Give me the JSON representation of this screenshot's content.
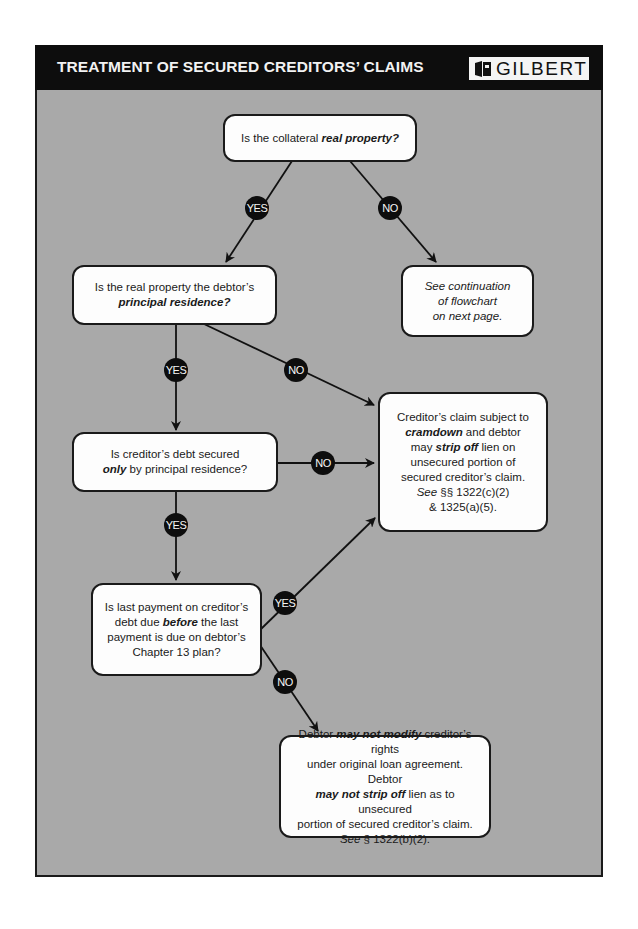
{
  "header": {
    "title": "TREATMENT OF SECURED CREDITORS’ CLAIMS",
    "logo_text": "GILBERT"
  },
  "colors": {
    "header_bg": "#0d0d0d",
    "panel_bg": "#a9a9a9",
    "box_bg": "#fdfdfd",
    "badge_bg": "#0d0d0d"
  },
  "nodes": {
    "q1": {
      "pre": "Is the collateral ",
      "em": "real property?"
    },
    "q2": {
      "line1": "Is the real property the debtor’s",
      "em": "principal residence?"
    },
    "cont": {
      "line1": "See continuation",
      "line2": "of flowchart",
      "line3": "on next page."
    },
    "q3": {
      "line1": "Is creditor’s debt secured",
      "em": "only",
      "post": " by principal residence?"
    },
    "cramdown": {
      "l1": "Creditor’s claim subject to",
      "l2_em": "cramdown",
      "l2_post": " and debtor",
      "l3_pre": "may ",
      "l3_em": "strip off",
      "l3_post": " lien on",
      "l4": "unsecured portion of",
      "l5": "secured creditor’s claim.",
      "l6_see": "See",
      "l6_post": " §§ 1322(c)(2)",
      "l7": "& 1325(a)(5)."
    },
    "q4": {
      "l1": "Is last payment on creditor’s",
      "l2_pre": "debt due ",
      "l2_em": "before",
      "l2_post": " the last",
      "l3": "payment is due on debtor’s",
      "l4": "Chapter 13 plan?"
    },
    "nomod": {
      "l1_pre": "Debtor ",
      "l1_em": "may not modify",
      "l1_post": " creditor’s rights",
      "l2": "under original loan agreement.  Debtor",
      "l3_em": "may not strip off",
      "l3_post": " lien as to unsecured",
      "l4": "portion  of secured creditor’s claim.",
      "l5_see": "See",
      "l5_post": " § 1322(b)(2)."
    }
  },
  "badges": {
    "q1_yes": "YES",
    "q1_no": "NO",
    "q2_yes": "YES",
    "q2_no": "NO",
    "q3_yes": "YES",
    "q3_no": "NO",
    "q4_yes": "YES",
    "q4_no": "NO"
  }
}
